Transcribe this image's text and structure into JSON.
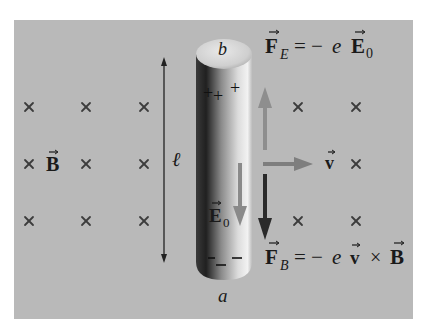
{
  "diagram": {
    "type": "physics-motional-emf",
    "background_color": "#b9b9b9",
    "conductor": {
      "top_label": "b",
      "bottom_label": "a",
      "top_charges": [
        "+",
        "+",
        "+"
      ],
      "bottom_charges": [
        "−",
        "−",
        "−"
      ]
    },
    "length_label": "ℓ",
    "field_label": "B",
    "field_direction": "into-page",
    "field_marker": "×",
    "internal_field_label": "E",
    "internal_field_subscript": "0",
    "velocity_label": "v",
    "electric_force": {
      "lhs": "F",
      "lhs_subscript": "E",
      "equals": "= −",
      "charge": "e",
      "rhs": "E",
      "rhs_subscript": "0"
    },
    "magnetic_force": {
      "lhs": "F",
      "lhs_subscript": "B",
      "equals": "= −",
      "charge": "e",
      "v": "v",
      "cross": "×",
      "rhs": "B"
    },
    "colors": {
      "electric_force_arrow": "#8e8e8e",
      "magnetic_force_arrow": "#2a2a2a",
      "velocity_arrow": "#7e7e7e",
      "internal_field_arrow": "#8a8a8a",
      "text": "#1a1a1a"
    }
  }
}
